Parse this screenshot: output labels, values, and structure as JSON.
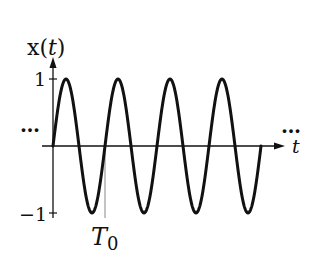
{
  "diagram": {
    "y_axis_label": "x(t)",
    "y_axis_label_parts": {
      "x": "x(",
      "t": "t",
      "close": ")"
    },
    "x_axis_label": "t",
    "ticks": {
      "top": "1",
      "bottom": "−1"
    },
    "period_label": {
      "main": "T",
      "sub": "0"
    },
    "ellipsis_left": "…",
    "ellipsis_right": "…",
    "signal": {
      "amplitude": 1,
      "cycles_shown": 4.2,
      "form": "sin(2πt/T0)"
    },
    "colors": {
      "curve": "#111111",
      "axes": "#111111",
      "marker": "#888888"
    }
  }
}
